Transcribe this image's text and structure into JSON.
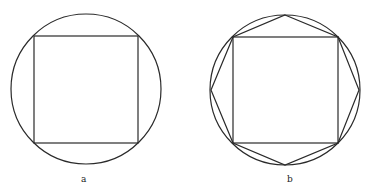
{
  "figures": [
    {
      "label": "a",
      "description": "square inscribed in circle",
      "circle": {
        "cx": 86,
        "cy": 89,
        "r": 75
      },
      "square": {
        "x": 34,
        "y": 36,
        "w": 104,
        "h": 107
      },
      "label_pos": {
        "x": 81,
        "y": 182
      }
    },
    {
      "label": "b",
      "description": "square and octagon inscribed in circle",
      "circle": {
        "cx": 285,
        "cy": 90,
        "r": 75
      },
      "square": {
        "x": 233,
        "y": 37,
        "w": 105,
        "h": 106
      },
      "octagon_points": "285,15 338,37 359,90 338,143 285,165 233,143 211,90 233,37",
      "label_pos": {
        "x": 287,
        "y": 182
      }
    }
  ],
  "colors": {
    "stroke": "#2a2a2a",
    "background": "#ffffff"
  }
}
